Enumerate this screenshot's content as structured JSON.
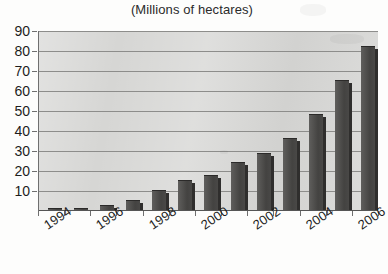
{
  "chart_data": {
    "type": "bar",
    "title": "(Millions of hectares)",
    "subtitle": "",
    "xlabel": "",
    "ylabel": "",
    "ylim": [
      0,
      90
    ],
    "ytick_step": 10,
    "yticks": [
      0,
      10,
      20,
      30,
      40,
      50,
      60,
      70,
      80,
      90
    ],
    "ytick_labels": [
      "10",
      "20",
      "30",
      "40",
      "50",
      "60",
      "70",
      "80",
      "90"
    ],
    "grid": true,
    "legend": "none",
    "categories": [
      "1994",
      "1995",
      "1996",
      "1997",
      "1998",
      "1999",
      "2000",
      "2001",
      "2002",
      "2003",
      "2004",
      "2005",
      "2006"
    ],
    "visible_tick_labels": [
      "1994",
      "1996",
      "1998",
      "2000",
      "2002",
      "2004",
      "2006"
    ],
    "values": [
      0.5,
      1,
      2.5,
      5,
      10,
      15,
      17.5,
      24,
      28.5,
      36,
      48,
      65,
      82
    ],
    "bar_color": "#4d4c4a",
    "bar_side_color": "#2f2e2d",
    "plot_background": "#d6d6d4",
    "gridline_color": "#8d8d8b",
    "text_color": "#1d1d1d",
    "page_background": "#fdfdfc"
  }
}
